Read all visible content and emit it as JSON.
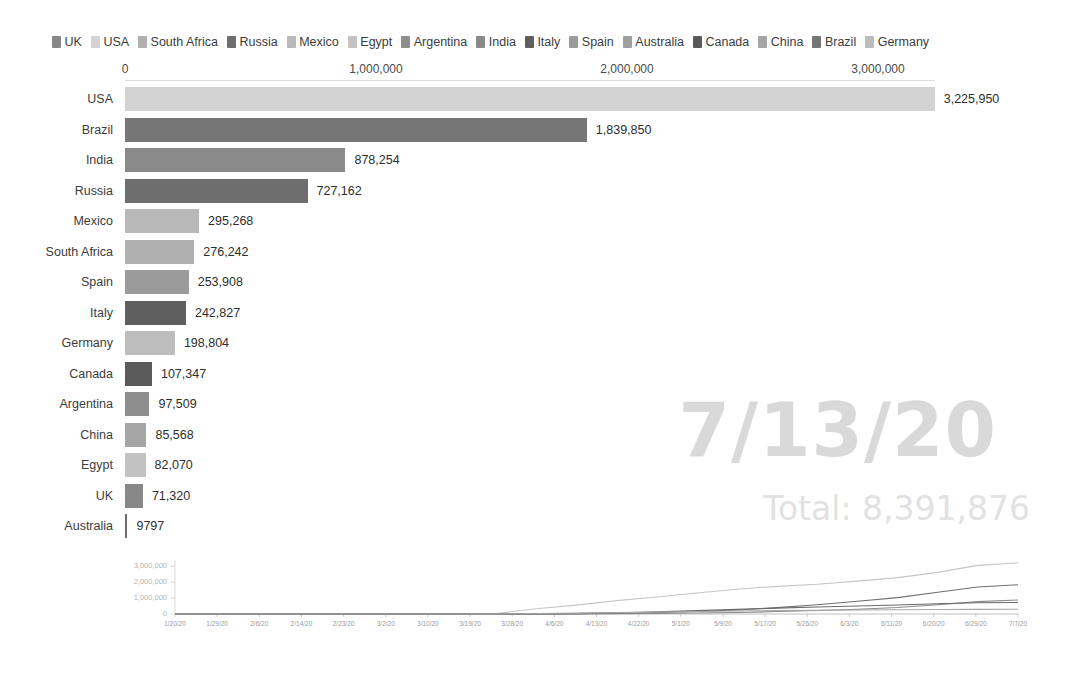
{
  "chart_data": {
    "type": "bar",
    "title": "",
    "xlabel": "",
    "ylabel": "",
    "xlim": [
      0,
      3400000
    ],
    "grid": false,
    "legend_position": "top",
    "date_label": "7/13/20",
    "total_label": "Total: 8,391,876",
    "total_value": 8391876,
    "axis_ticks": [
      {
        "label": "0",
        "value": 0
      },
      {
        "label": "1,000,000",
        "value": 1000000
      },
      {
        "label": "2,000,000",
        "value": 2000000
      },
      {
        "label": "3,000,000",
        "value": 3000000
      }
    ],
    "categories": [
      "USA",
      "Brazil",
      "India",
      "Russia",
      "Mexico",
      "South Africa",
      "Spain",
      "Italy",
      "Germany",
      "Canada",
      "Argentina",
      "China",
      "Egypt",
      "UK",
      "Australia"
    ],
    "values": [
      3225950,
      1839850,
      878254,
      727162,
      295268,
      276242,
      253908,
      242827,
      198804,
      107347,
      97509,
      85568,
      82070,
      71320,
      9797
    ],
    "value_labels": [
      "3,225,950",
      "1,839,850",
      "878,254",
      "727,162",
      "295,268",
      "276,242",
      "253,908",
      "242,827",
      "198,804",
      "107,347",
      "97,509",
      "85,568",
      "82,070",
      "71,320",
      "9797"
    ],
    "bar_colors": [
      "#d3d3d3",
      "#767676",
      "#8a8a8a",
      "#6e6e6e",
      "#b9b9b9",
      "#b0b0b0",
      "#9b9b9b",
      "#5f5f5f",
      "#bdbdbd",
      "#5a5a5a",
      "#8e8e8e",
      "#a5a5a5",
      "#c2c2c2",
      "#888888",
      "#6d6d6d"
    ]
  },
  "legend": {
    "items": [
      {
        "label": "UK",
        "color": "#888888"
      },
      {
        "label": "USA",
        "color": "#d3d3d3"
      },
      {
        "label": "South Africa",
        "color": "#b0b0b0"
      },
      {
        "label": "Russia",
        "color": "#6e6e6e"
      },
      {
        "label": "Mexico",
        "color": "#b9b9b9"
      },
      {
        "label": "Egypt",
        "color": "#c2c2c2"
      },
      {
        "label": "Argentina",
        "color": "#8e8e8e"
      },
      {
        "label": "India",
        "color": "#8a8a8a"
      },
      {
        "label": "Italy",
        "color": "#5f5f5f"
      },
      {
        "label": "Spain",
        "color": "#9b9b9b"
      },
      {
        "label": "Australia",
        "color": "#9f9f9f"
      },
      {
        "label": "Canada",
        "color": "#5a5a5a"
      },
      {
        "label": "China",
        "color": "#a5a5a5"
      },
      {
        "label": "Brazil",
        "color": "#767676"
      },
      {
        "label": "Germany",
        "color": "#bdbdbd"
      }
    ]
  },
  "sparkline": {
    "type": "line",
    "ylabels": [
      "3,000,000",
      "2,000,000",
      "1,000,000",
      "0"
    ],
    "yticks": [
      3000000,
      2000000,
      1000000,
      0
    ],
    "ylim": [
      0,
      3400000
    ],
    "xlabels": [
      "1/20/20",
      "1/29/20",
      "2/6/20",
      "2/14/20",
      "2/23/20",
      "3/2/20",
      "3/10/20",
      "3/19/20",
      "3/28/20",
      "4/6/20",
      "4/13/20",
      "4/22/20",
      "5/1/20",
      "5/9/20",
      "5/17/20",
      "5/26/20",
      "6/3/20",
      "6/11/20",
      "6/20/20",
      "6/29/20",
      "7/7/20"
    ],
    "series": [
      {
        "name": "USA",
        "color": "#c6c6c6",
        "values": [
          0,
          0,
          0,
          0,
          0,
          0,
          1,
          2500,
          35000,
          330000,
          560000,
          840000,
          1070000,
          1320000,
          1560000,
          1740000,
          1870000,
          2070000,
          2290000,
          2620000,
          3060000,
          3225950
        ]
      },
      {
        "name": "Brazil",
        "color": "#6f6f6f",
        "values": [
          0,
          0,
          0,
          0,
          0,
          0,
          0,
          200,
          3900,
          12000,
          24000,
          46000,
          92000,
          156000,
          255000,
          400000,
          580000,
          800000,
          1030000,
          1370000,
          1700000,
          1839850
        ]
      },
      {
        "name": "India",
        "color": "#8a8a8a",
        "values": [
          0,
          0,
          0,
          0,
          0,
          0,
          0,
          200,
          1000,
          4700,
          11000,
          21000,
          36000,
          60000,
          96000,
          153000,
          217000,
          298000,
          410000,
          580000,
          780000,
          878254
        ]
      },
      {
        "name": "Russia",
        "color": "#6a6a6a",
        "values": [
          0,
          0,
          0,
          0,
          0,
          0,
          0,
          150,
          1000,
          7500,
          21000,
          63000,
          135000,
          210000,
          290000,
          370000,
          440000,
          500000,
          570000,
          650000,
          710000,
          727162
        ]
      },
      {
        "name": "Others",
        "color": "#a6a6a6",
        "values": [
          0,
          0,
          0,
          0,
          0,
          0,
          100,
          1200,
          9000,
          30000,
          55000,
          85000,
          120000,
          155000,
          190000,
          215000,
          235000,
          255000,
          272000,
          285000,
          292000,
          295268
        ]
      }
    ]
  }
}
